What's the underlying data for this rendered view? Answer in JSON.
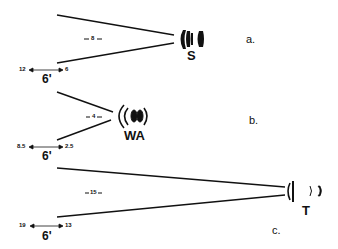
{
  "panels": [
    {
      "id": "a",
      "label": "a.",
      "lens_type": "S",
      "lens_icon": "standard-lens-icon",
      "spread_value": "8",
      "range_far": "12",
      "range_near": "6",
      "distance": "6'"
    },
    {
      "id": "b",
      "label": "b.",
      "lens_type": "WA",
      "lens_icon": "wide-angle-lens-icon",
      "spread_value": "4",
      "range_far": "8.5",
      "range_near": "2.5",
      "distance": "6'"
    },
    {
      "id": "c",
      "label": "c.",
      "lens_type": "T",
      "lens_icon": "telephoto-lens-icon",
      "spread_value": "15",
      "range_far": "19",
      "range_near": "13",
      "distance": "6'"
    }
  ],
  "colors": {
    "ink": "#111111",
    "background": "#ffffff"
  }
}
